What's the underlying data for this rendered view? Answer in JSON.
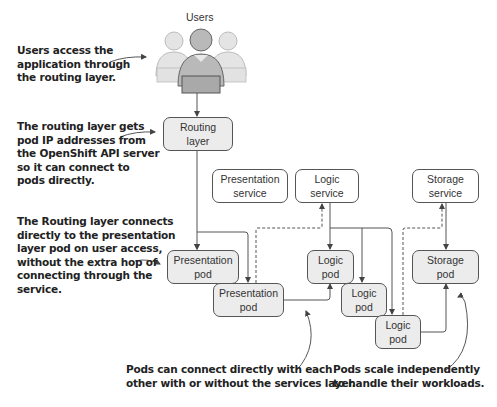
{
  "users": {
    "label": "Users"
  },
  "annotations": {
    "users_access": "Users access the\napplication through\nthe routing layer.",
    "routing_ips": "The routing layer gets\npod IP addresses from\nthe OpenShift API server\nso it can connect to\npods directly.",
    "routing_connects": "The Routing layer connects\ndirectly to the presentation\nlayer pod on user access,\nwithout the extra hop of\nconnecting through the\nservice.",
    "pods_connect": "Pods can connect directly with each\nother with or without the services layer.",
    "pods_scale": "Pods scale independently\nto handle their workloads."
  },
  "nodes": {
    "routing_layer": "Routing\nlayer",
    "presentation_service": "Presentation\nservice",
    "logic_service": "Logic\nservice",
    "storage_service": "Storage\nservice",
    "presentation_pod_1": "Presentation\npod",
    "presentation_pod_2": "Presentation\npod",
    "logic_pod_1": "Logic\npod",
    "logic_pod_2": "Logic\npod",
    "logic_pod_3": "Logic\npod",
    "storage_pod": "Storage\npod"
  },
  "colors": {
    "pod_fill": "#ececec",
    "service_fill": "#ffffff",
    "line": "#555555",
    "text": "#222222"
  }
}
